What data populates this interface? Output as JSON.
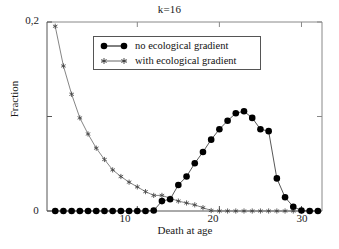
{
  "chart_data": {
    "type": "line",
    "title": "k=16",
    "xlabel": "Death at age",
    "ylabel": "Fraction",
    "xlim": [
      -1,
      32.5
    ],
    "ylim": [
      0,
      0.2
    ],
    "grid": false,
    "legend_position": "upper center",
    "x_ticks": [
      10,
      20,
      30
    ],
    "x_tick_labels": [
      "10",
      "20",
      "30"
    ],
    "y_ticks": [
      0,
      0.1,
      0.2
    ],
    "y_tick_labels": [
      "0",
      "",
      "0,2"
    ],
    "y_axis_origin_label": "0",
    "y_axis_top_label": "0,2",
    "series": [
      {
        "name": "no ecological gradient",
        "marker": "filled-circle",
        "color": "#000000",
        "x": [
          0,
          1,
          2,
          3,
          4,
          5,
          6,
          7,
          8,
          9,
          10,
          11,
          12,
          13,
          14,
          15,
          16,
          17,
          18,
          19,
          20,
          21,
          22,
          23,
          24,
          25,
          26,
          27,
          28,
          29,
          30,
          31,
          32
        ],
        "values": [
          0.0,
          0.0,
          0.0,
          0.0,
          0.0,
          0.0,
          0.0,
          0.0,
          0.0,
          0.0,
          0.0,
          0.0,
          0.0005,
          0.0105,
          0.0125,
          0.0275,
          0.0365,
          0.0505,
          0.0625,
          0.0755,
          0.0865,
          0.0955,
          0.1035,
          0.1055,
          0.0985,
          0.0865,
          0.0845,
          0.0345,
          0.0145,
          0.0045,
          0.0005,
          0.0,
          0.0
        ]
      },
      {
        "name": "with ecological gradient",
        "marker": "star",
        "color": "#555555",
        "x": [
          0,
          1,
          2,
          3,
          4,
          5,
          6,
          7,
          8,
          9,
          10,
          11,
          12,
          13,
          14,
          15,
          16,
          17,
          18,
          19,
          20,
          21,
          22,
          23,
          24,
          25,
          26,
          27,
          28,
          29,
          30,
          31,
          32
        ],
        "values": [
          0.1955,
          0.1535,
          0.1235,
          0.0985,
          0.0815,
          0.0665,
          0.0545,
          0.0435,
          0.0365,
          0.0305,
          0.0255,
          0.0205,
          0.0165,
          0.0165,
          0.0135,
          0.0105,
          0.0085,
          0.0065,
          0.0035,
          0.0005,
          0.0,
          0.0,
          0.0,
          0.0,
          0.0,
          0.0,
          0.0,
          0.0,
          0.0,
          0.0,
          0.0,
          0.0,
          0.0
        ]
      }
    ]
  },
  "legend": {
    "entries": [
      {
        "label": "no ecological gradient",
        "marker": "filled-circle"
      },
      {
        "label": "with ecological gradient",
        "marker": "star"
      }
    ]
  }
}
